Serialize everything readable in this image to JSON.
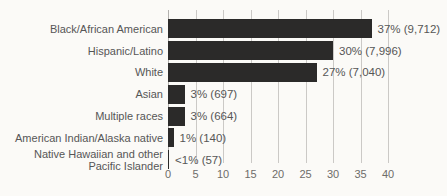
{
  "chart_data": {
    "type": "bar",
    "orientation": "horizontal",
    "title": "",
    "xlabel": "",
    "ylabel": "",
    "categories": [
      "Black/African American",
      "Hispanic/Latino",
      "White",
      "Asian",
      "Multiple races",
      "American Indian/Alaska native",
      "Native Hawaiian and other\nPacific Islander"
    ],
    "values": [
      37,
      30,
      27,
      3,
      3,
      1,
      0.2
    ],
    "value_labels": [
      "37% (9,712)",
      "30% (7,996)",
      "27% (7,040)",
      "3% (697)",
      "3% (664)",
      "1% (140)",
      "<1% (57)"
    ],
    "counts": [
      9712,
      7996,
      7040,
      697,
      664,
      140,
      57
    ],
    "xlim": [
      0,
      40
    ],
    "xticks": [
      0,
      5,
      10,
      15,
      20,
      25,
      30,
      35,
      40
    ],
    "grid": "vertical",
    "legend": "none"
  },
  "colors": {
    "bar": "#2b2a29",
    "text": "#565656",
    "tick": "#6e6c69",
    "grid": "#cbc9c6",
    "axis": "#b3b1ae",
    "background": "#fbfaf7"
  }
}
